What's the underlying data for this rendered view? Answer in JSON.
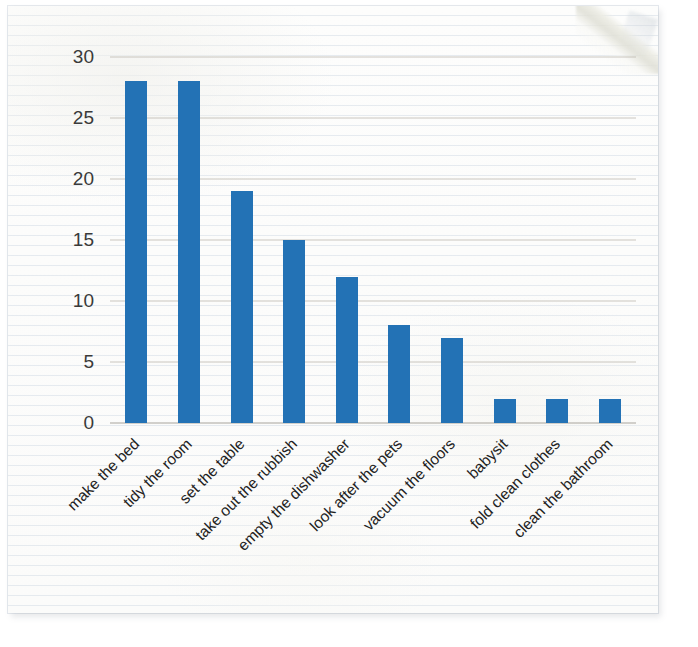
{
  "document": {
    "kind": "photographed-worksheet",
    "media": "lined-paper",
    "paper_color": "#fcfcfb"
  },
  "chart_data": {
    "type": "bar",
    "title": "",
    "subtitle": "",
    "xlabel": "",
    "ylabel": "",
    "categories": [
      "make the bed",
      "tidy the room",
      "set the table",
      "take out the rubbish",
      "empty the dishwasher",
      "look after the pets",
      "vacuum the floors",
      "babysit",
      "fold clean clothes",
      "clean the bathroom"
    ],
    "values": [
      28,
      28,
      19,
      15,
      12,
      8,
      7,
      2,
      2,
      2
    ],
    "ylim": [
      0,
      30
    ],
    "ytick_values": [
      0,
      5,
      10,
      15,
      20,
      25,
      30
    ],
    "ytick_labels": [
      "0",
      "5",
      "10",
      "15",
      "20",
      "25",
      "30"
    ],
    "grid": true,
    "grid_axis": "y",
    "legend": false,
    "legend_position": "none",
    "bar_color": "#2372b5",
    "gridline_color": "#b9b4ab",
    "axis_color": "#a8a49c",
    "tick_label_color": "#333333",
    "xtick_label_rotation": -45,
    "series": [
      {
        "name": "count",
        "values": [
          28,
          28,
          19,
          15,
          12,
          8,
          7,
          2,
          2,
          2
        ]
      }
    ]
  }
}
